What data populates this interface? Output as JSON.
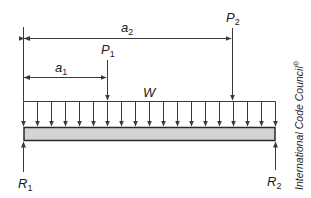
{
  "diagram": {
    "type": "beam-load-diagram",
    "labels": {
      "a2": {
        "main": "a",
        "sub": "2"
      },
      "a1": {
        "main": "a",
        "sub": "1"
      },
      "P1": {
        "main": "P",
        "sub": "1"
      },
      "P2": {
        "main": "P",
        "sub": "2"
      },
      "W": {
        "main": "W"
      },
      "R1": {
        "main": "R",
        "sub": "1"
      },
      "R2": {
        "main": "R",
        "sub": "2"
      }
    },
    "credit": "International Code Council",
    "credit_mark": "®",
    "distributed_load_arrow_count": 19,
    "colors": {
      "line": "#3a3a3a",
      "beam_fill": "#d4d4d4",
      "beam_edge": "#2a2a2a",
      "background": "#ffffff"
    }
  }
}
